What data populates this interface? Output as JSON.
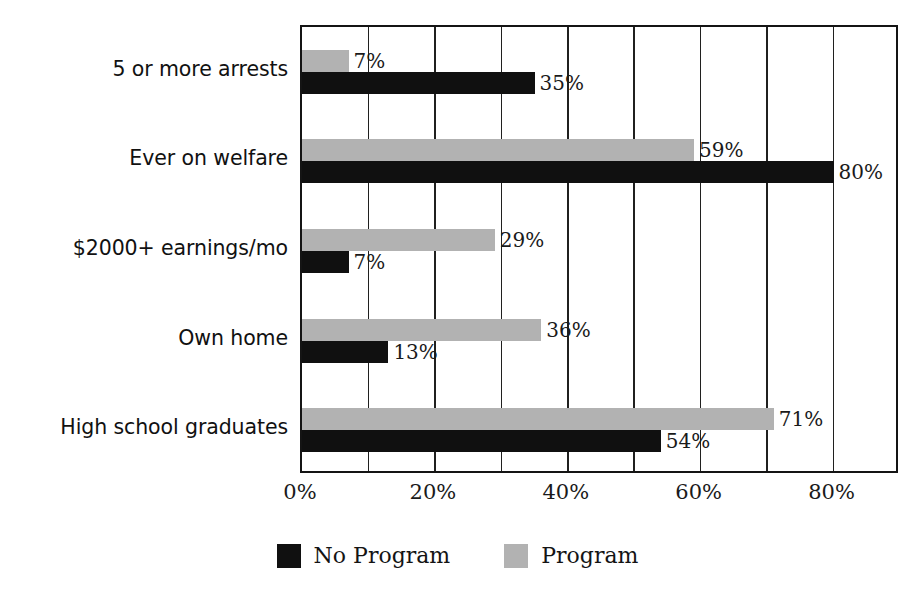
{
  "chart_data": {
    "type": "bar",
    "orientation": "horizontal",
    "title": "",
    "subtitle": "",
    "xlabel": "",
    "ylabel": "",
    "xlim": [
      0,
      90
    ],
    "categories": [
      "5 or more arrests",
      "Ever on welfare",
      "$2000+ earnings/mo",
      "Own home",
      "High school graduates"
    ],
    "series": [
      {
        "name": "Program",
        "color": "#b2b2b2",
        "values": [
          7,
          59,
          29,
          36,
          71
        ],
        "labels": [
          "7%",
          "59%",
          "29%",
          "36%",
          "71%"
        ]
      },
      {
        "name": "No Program",
        "color": "#101010",
        "values": [
          35,
          80,
          7,
          13,
          54
        ],
        "labels": [
          "35%",
          "80%",
          "7%",
          "13%",
          "54%"
        ]
      }
    ],
    "xticks": [
      0,
      20,
      40,
      60,
      80
    ],
    "xtick_labels": [
      "0%",
      "20%",
      "40%",
      "60%",
      "80%"
    ],
    "gridlines_at": [
      0,
      10,
      20,
      30,
      40,
      50,
      60,
      70,
      80,
      90
    ],
    "grid": true,
    "legend_position": "bottom",
    "legend": [
      {
        "label": "No Program",
        "color": "#101010"
      },
      {
        "label": "Program",
        "color": "#b2b2b2"
      }
    ]
  },
  "axis": {
    "x_unit": "%"
  }
}
